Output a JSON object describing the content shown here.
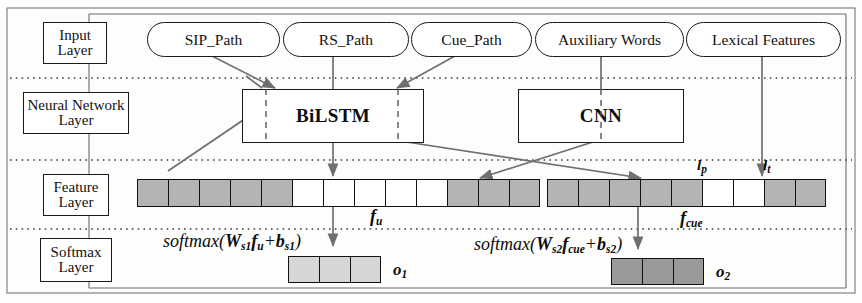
{
  "figure": {
    "type": "neural-network-architecture-diagram",
    "border_color": "#555555",
    "background": "#fdfdfc"
  },
  "layers": [
    {
      "id": "input",
      "label": "Input\nLayer"
    },
    {
      "id": "neural",
      "label": "Neural Network\nLayer"
    },
    {
      "id": "feature",
      "label": "Feature\nLayer"
    },
    {
      "id": "softmax",
      "label": "Softmax\nLayer"
    }
  ],
  "layer_labels": {
    "input": "Input Layer",
    "neural": "Neural Network Layer",
    "feature": "Feature Layer",
    "softmax": "Softmax Layer"
  },
  "input_nodes": [
    {
      "id": "sip_path",
      "label": "SIP_Path"
    },
    {
      "id": "rs_path",
      "label": "RS_Path"
    },
    {
      "id": "cue_path",
      "label": "Cue_Path"
    },
    {
      "id": "aux_words",
      "label": "Auxiliary Words"
    },
    {
      "id": "lex_feat",
      "label": "Lexical Features"
    }
  ],
  "nn_modules": [
    {
      "id": "bilstm",
      "label": "BiLSTM"
    },
    {
      "id": "cnn",
      "label": "CNN"
    }
  ],
  "feature_bars": [
    {
      "id": "f_u",
      "label": "f",
      "label_sub": "u",
      "cells": [
        "g",
        "g",
        "g",
        "g",
        "g",
        "w",
        "w",
        "w",
        "w",
        "w",
        "g",
        "g",
        "g"
      ],
      "colors": {
        "g": "#b4b4b4",
        "w": "#ffffff"
      }
    },
    {
      "id": "f_cue",
      "label": "f",
      "label_sub": "cue",
      "cells": [
        "g",
        "g",
        "g",
        "g",
        "g",
        "w",
        "w",
        "g",
        "g"
      ],
      "colors": {
        "g": "#b4b4b4",
        "w": "#ffffff"
      },
      "ticks": [
        {
          "id": "l_p",
          "label": "l",
          "sub": "p"
        },
        {
          "id": "l_t",
          "label": "l",
          "sub": "t"
        }
      ]
    }
  ],
  "softmax": [
    {
      "id": "o1",
      "formula": "softmax(W",
      "formula_parts": {
        "fn": "softmax(",
        "w": "W",
        "w_sub": "s1",
        "f": "f",
        "f_sub": "u",
        "plus": "+",
        "b": "b",
        "b_sub": "s1",
        "close": ")"
      },
      "formula_text": "softmax(Ws1fu+bs1)",
      "output_label": "o",
      "output_sub": "1",
      "cells": [
        "lg",
        "lg",
        "lg"
      ],
      "cell_color": "#d6d6d6"
    },
    {
      "id": "o2",
      "formula_parts": {
        "fn": "softmax(",
        "w": "W",
        "w_sub": "s2",
        "f": "f",
        "f_sub": "cue",
        "plus": "+",
        "b": "b",
        "b_sub": "s2",
        "close": ")"
      },
      "formula_text": "softmax(Ws2fcue+bs2)",
      "output_label": "o",
      "output_sub": "2",
      "cells": [
        "dg",
        "dg",
        "dg"
      ],
      "cell_color": "#9a9a9a"
    }
  ],
  "colors": {
    "stroke": "#1a1a1a",
    "arrow": "#6f6f6f",
    "dotted": "#3c3c3c",
    "cell_gray": "#b4b4b4",
    "cell_light": "#d6d6d6",
    "cell_dark": "#9a9a9a"
  }
}
